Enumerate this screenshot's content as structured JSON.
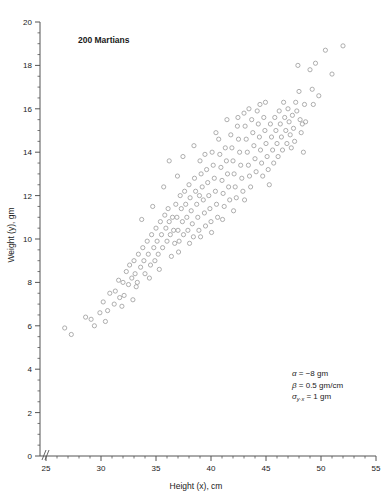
{
  "chart_data": {
    "type": "scatter",
    "title": "200 Martians",
    "xlabel": "Height (x), cm",
    "ylabel": "Weight (y), gm",
    "xlim": [
      25,
      55
    ],
    "ylim": [
      0,
      20
    ],
    "x_major_ticks": [
      25,
      30,
      35,
      40,
      45,
      50,
      55
    ],
    "y_major_ticks": [
      0,
      2,
      4,
      6,
      8,
      10,
      12,
      14,
      16,
      18,
      20
    ],
    "x_minor_step": 1,
    "y_minor_step": 0.5,
    "grid": false,
    "legend": "none",
    "axis_break": "origin",
    "marker": "open-circle",
    "marker_color": "#9a9a9a",
    "n_points": 200,
    "annotations": [
      {
        "symbol": "α",
        "sub": "",
        "text": " = −8 gm"
      },
      {
        "symbol": "β",
        "sub": "",
        "text": " = 0.5 gm/cm"
      },
      {
        "symbol": "σ",
        "sub": "y·x",
        "text": " = 1 gm"
      }
    ],
    "points": [
      [
        26.7,
        5.9
      ],
      [
        27.3,
        5.6
      ],
      [
        28.6,
        6.4
      ],
      [
        29.4,
        6.0
      ],
      [
        29.9,
        6.6
      ],
      [
        30.2,
        7.1
      ],
      [
        30.6,
        6.7
      ],
      [
        30.8,
        7.5
      ],
      [
        31.2,
        7.0
      ],
      [
        31.3,
        7.6
      ],
      [
        31.6,
        8.1
      ],
      [
        31.7,
        7.3
      ],
      [
        32.0,
        8.0
      ],
      [
        32.1,
        7.4
      ],
      [
        32.3,
        8.5
      ],
      [
        32.5,
        7.9
      ],
      [
        32.6,
        8.8
      ],
      [
        32.8,
        8.2
      ],
      [
        33.0,
        9.0
      ],
      [
        33.1,
        8.4
      ],
      [
        33.3,
        8.0
      ],
      [
        33.4,
        9.3
      ],
      [
        33.6,
        8.7
      ],
      [
        33.8,
        9.6
      ],
      [
        33.9,
        9.0
      ],
      [
        34.0,
        8.4
      ],
      [
        34.2,
        9.9
      ],
      [
        34.3,
        9.3
      ],
      [
        34.5,
        8.8
      ],
      [
        34.6,
        10.2
      ],
      [
        34.8,
        9.6
      ],
      [
        34.9,
        9.0
      ],
      [
        35.0,
        10.5
      ],
      [
        35.1,
        9.9
      ],
      [
        35.2,
        9.3
      ],
      [
        35.4,
        10.8
      ],
      [
        35.5,
        10.2
      ],
      [
        35.6,
        9.6
      ],
      [
        35.8,
        11.1
      ],
      [
        35.9,
        10.5
      ],
      [
        36.0,
        9.9
      ],
      [
        36.1,
        11.4
      ],
      [
        36.2,
        10.8
      ],
      [
        36.3,
        10.2
      ],
      [
        36.5,
        11.0
      ],
      [
        36.6,
        10.4
      ],
      [
        36.7,
        9.8
      ],
      [
        36.8,
        11.6
      ],
      [
        36.9,
        11.0
      ],
      [
        37.0,
        10.4
      ],
      [
        37.1,
        9.9
      ],
      [
        37.2,
        12.0
      ],
      [
        37.3,
        11.4
      ],
      [
        37.4,
        10.8
      ],
      [
        37.5,
        10.2
      ],
      [
        37.6,
        12.2
      ],
      [
        37.7,
        11.6
      ],
      [
        37.8,
        11.0
      ],
      [
        37.9,
        10.4
      ],
      [
        38.0,
        12.5
      ],
      [
        38.1,
        11.9
      ],
      [
        38.2,
        11.3
      ],
      [
        38.3,
        10.7
      ],
      [
        38.4,
        10.1
      ],
      [
        38.5,
        12.8
      ],
      [
        38.6,
        12.2
      ],
      [
        38.7,
        11.6
      ],
      [
        38.8,
        11.0
      ],
      [
        38.9,
        10.4
      ],
      [
        39.0,
        13.6
      ],
      [
        39.1,
        13.0
      ],
      [
        39.2,
        12.4
      ],
      [
        39.3,
        11.8
      ],
      [
        39.4,
        11.2
      ],
      [
        39.5,
        10.6
      ],
      [
        39.6,
        13.2
      ],
      [
        39.7,
        12.6
      ],
      [
        39.8,
        12.0
      ],
      [
        39.9,
        11.4
      ],
      [
        40.0,
        10.8
      ],
      [
        40.1,
        14.0
      ],
      [
        40.2,
        13.4
      ],
      [
        40.3,
        12.8
      ],
      [
        40.4,
        12.2
      ],
      [
        40.5,
        11.6
      ],
      [
        40.6,
        11.0
      ],
      [
        40.7,
        14.6
      ],
      [
        40.8,
        13.9
      ],
      [
        40.9,
        13.3
      ],
      [
        41.0,
        12.7
      ],
      [
        41.1,
        12.1
      ],
      [
        41.2,
        11.5
      ],
      [
        41.3,
        14.2
      ],
      [
        41.4,
        13.6
      ],
      [
        41.5,
        13.0
      ],
      [
        41.6,
        12.4
      ],
      [
        41.7,
        11.8
      ],
      [
        41.8,
        14.8
      ],
      [
        41.9,
        14.2
      ],
      [
        42.0,
        13.6
      ],
      [
        42.1,
        13.0
      ],
      [
        42.2,
        12.4
      ],
      [
        42.3,
        11.9
      ],
      [
        42.4,
        15.2
      ],
      [
        42.5,
        14.6
      ],
      [
        42.6,
        14.0
      ],
      [
        42.7,
        13.4
      ],
      [
        42.8,
        12.8
      ],
      [
        42.9,
        12.2
      ],
      [
        43.0,
        15.8
      ],
      [
        43.1,
        15.2
      ],
      [
        43.2,
        14.6
      ],
      [
        43.3,
        14.0
      ],
      [
        43.4,
        13.4
      ],
      [
        43.5,
        12.9
      ],
      [
        43.6,
        12.4
      ],
      [
        43.7,
        15.5
      ],
      [
        43.8,
        14.9
      ],
      [
        43.9,
        14.3
      ],
      [
        44.0,
        13.7
      ],
      [
        44.1,
        13.1
      ],
      [
        44.2,
        15.9
      ],
      [
        44.3,
        15.3
      ],
      [
        44.4,
        14.7
      ],
      [
        44.5,
        14.1
      ],
      [
        44.6,
        13.5
      ],
      [
        44.7,
        12.9
      ],
      [
        44.8,
        15.6
      ],
      [
        44.9,
        15.0
      ],
      [
        45.0,
        14.4
      ],
      [
        45.1,
        13.8
      ],
      [
        45.2,
        13.2
      ],
      [
        45.3,
        12.5
      ],
      [
        45.4,
        15.3
      ],
      [
        45.5,
        14.7
      ],
      [
        45.6,
        14.1
      ],
      [
        45.7,
        13.5
      ],
      [
        45.8,
        15.6
      ],
      [
        45.9,
        15.0
      ],
      [
        46.0,
        14.4
      ],
      [
        46.1,
        13.8
      ],
      [
        46.2,
        15.9
      ],
      [
        46.3,
        15.3
      ],
      [
        46.4,
        14.7
      ],
      [
        46.5,
        14.1
      ],
      [
        46.6,
        16.3
      ],
      [
        46.7,
        15.6
      ],
      [
        46.8,
        15.0
      ],
      [
        46.9,
        14.4
      ],
      [
        47.0,
        16.0
      ],
      [
        47.1,
        15.4
      ],
      [
        47.2,
        14.8
      ],
      [
        47.3,
        14.2
      ],
      [
        47.4,
        15.7
      ],
      [
        47.5,
        15.1
      ],
      [
        47.6,
        14.5
      ],
      [
        47.7,
        16.3
      ],
      [
        47.8,
        15.9
      ],
      [
        47.9,
        18.0
      ],
      [
        48.0,
        16.8
      ],
      [
        48.1,
        15.5
      ],
      [
        48.2,
        14.9
      ],
      [
        48.3,
        15.3
      ],
      [
        48.4,
        14.0
      ],
      [
        48.5,
        16.2
      ],
      [
        48.6,
        15.4
      ],
      [
        49.0,
        17.8
      ],
      [
        49.2,
        16.9
      ],
      [
        49.3,
        16.2
      ],
      [
        49.5,
        18.1
      ],
      [
        49.8,
        16.6
      ],
      [
        50.4,
        18.7
      ],
      [
        51.0,
        17.6
      ],
      [
        52.0,
        18.9
      ],
      [
        33.2,
        7.8
      ],
      [
        34.4,
        8.2
      ],
      [
        35.3,
        8.6
      ],
      [
        36.4,
        9.2
      ],
      [
        37.05,
        9.4
      ],
      [
        38.05,
        9.8
      ],
      [
        39.05,
        10.1
      ],
      [
        40.05,
        10.3
      ],
      [
        41.05,
        10.9
      ],
      [
        42.05,
        11.3
      ],
      [
        43.05,
        11.8
      ],
      [
        36.2,
        13.6
      ],
      [
        37.45,
        13.8
      ],
      [
        38.45,
        14.3
      ],
      [
        39.45,
        13.9
      ],
      [
        40.45,
        14.9
      ],
      [
        41.45,
        15.5
      ],
      [
        42.45,
        15.6
      ],
      [
        43.45,
        16.0
      ],
      [
        44.45,
        16.2
      ],
      [
        32.9,
        7.2
      ],
      [
        31.9,
        6.9
      ],
      [
        30.4,
        6.2
      ],
      [
        29.1,
        6.3
      ],
      [
        35.7,
        12.4
      ],
      [
        34.7,
        11.5
      ],
      [
        33.7,
        10.9
      ],
      [
        36.95,
        12.9
      ],
      [
        38.95,
        12.0
      ],
      [
        44.95,
        16.3
      ]
    ]
  }
}
